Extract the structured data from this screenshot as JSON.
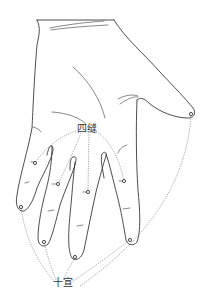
{
  "figure": {
    "labels": {
      "sifeng": "四缝",
      "shixuan": "十宣"
    },
    "colors": {
      "line": "#3a3a3a",
      "leader": "#6a6a6a",
      "background": "#ffffff"
    },
    "points": {
      "sifeng": [
        {
          "finger": "little",
          "x": 35,
          "y": 163
        },
        {
          "finger": "ring",
          "x": 58,
          "y": 184
        },
        {
          "finger": "middle",
          "x": 88,
          "y": 192
        },
        {
          "finger": "index",
          "x": 124,
          "y": 181
        }
      ],
      "shixuan": [
        {
          "finger": "little",
          "x": 21,
          "y": 207
        },
        {
          "finger": "ring",
          "x": 44,
          "y": 242
        },
        {
          "finger": "middle",
          "x": 75,
          "y": 257
        },
        {
          "finger": "index",
          "x": 130,
          "y": 240
        },
        {
          "finger": "thumb",
          "x": 191,
          "y": 114
        }
      ]
    }
  }
}
